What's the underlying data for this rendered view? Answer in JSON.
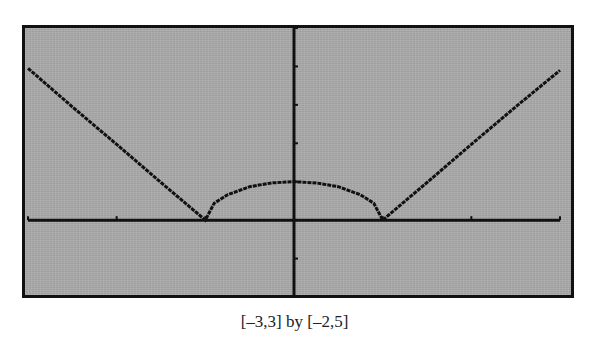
{
  "caption": "[–3,3] by [–2,5]",
  "colors": {
    "screen_bg": "#aaaaaa",
    "ink": "#111111"
  },
  "chart_data": {
    "type": "line",
    "title": "",
    "caption": "[–3,3] by [–2,5]",
    "xlabel": "",
    "ylabel": "",
    "xlim": [
      -3,
      3
    ],
    "ylim": [
      -2,
      5
    ],
    "xticks": [
      -3,
      -2,
      -1,
      0,
      1,
      2,
      3
    ],
    "yticks": [
      -2,
      -1,
      0,
      1,
      2,
      3,
      4,
      5
    ],
    "grid": false,
    "legend": null,
    "series": [
      {
        "name": "f(x)",
        "x": [
          -3,
          -2.5,
          -2,
          -1.5,
          -1,
          -0.9,
          -0.75,
          -0.5,
          -0.25,
          0,
          0.25,
          0.5,
          0.75,
          0.9,
          1,
          1.5,
          2,
          2.5,
          3
        ],
        "y": [
          3.95,
          2.95,
          1.97,
          0.98,
          0,
          0.44,
          0.66,
          0.87,
          0.97,
          1.0,
          0.97,
          0.87,
          0.66,
          0.44,
          0,
          0.98,
          1.97,
          2.95,
          3.9
        ]
      }
    ]
  }
}
